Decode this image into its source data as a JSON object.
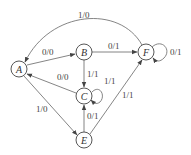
{
  "diagram": {
    "type": "state-transition-diagram",
    "states": [
      {
        "id": "A",
        "label": "A"
      },
      {
        "id": "B",
        "label": "B"
      },
      {
        "id": "C",
        "label": "C"
      },
      {
        "id": "E",
        "label": "E"
      },
      {
        "id": "F",
        "label": "F"
      }
    ],
    "transitions": [
      {
        "from": "F",
        "to": "A",
        "label": "1/0"
      },
      {
        "from": "A",
        "to": "B",
        "label": "0/0"
      },
      {
        "from": "B",
        "to": "F",
        "label": "0/1"
      },
      {
        "from": "F",
        "to": "F",
        "label": "0/1"
      },
      {
        "from": "B",
        "to": "C",
        "label": "1/1"
      },
      {
        "from": "C",
        "to": "C",
        "label": "1/1"
      },
      {
        "from": "C",
        "to": "A",
        "label": "0/0"
      },
      {
        "from": "A",
        "to": "E",
        "label": "1/0"
      },
      {
        "from": "E",
        "to": "C",
        "label": "0/1"
      },
      {
        "from": "E",
        "to": "F",
        "label": "1/1"
      }
    ]
  }
}
